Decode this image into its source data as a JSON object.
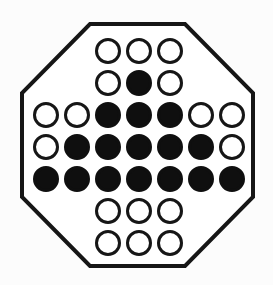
{
  "board": {
    "label": "octagonal-peg-solitaire-board",
    "canvas": {
      "width": 273,
      "height": 285
    },
    "colors": {
      "page_background": "#fcfcfc",
      "board_fill": "#ffffff",
      "outline": "#161616",
      "peg_fill": "#0f0f0f",
      "hole_fill": "#ffffff",
      "ring_stroke": "#161616"
    },
    "octagon": {
      "vertices": [
        [
          90,
          24
        ],
        [
          185,
          24
        ],
        [
          253,
          93
        ],
        [
          253,
          197
        ],
        [
          185,
          266
        ],
        [
          90,
          266
        ],
        [
          22,
          197
        ],
        [
          22,
          93
        ]
      ],
      "stroke_width": 4
    },
    "grid": {
      "col_x": [
        46,
        77,
        108,
        139,
        170,
        201,
        232
      ],
      "row_y": [
        51,
        83,
        115,
        147,
        179,
        211,
        243
      ],
      "hole_radius": 11.5,
      "ring_stroke_width": 3
    },
    "rows": [
      {
        "row": 0,
        "cols": [
          2,
          3,
          4
        ],
        "states": [
          "hole",
          "hole",
          "hole"
        ]
      },
      {
        "row": 1,
        "cols": [
          2,
          3,
          4
        ],
        "states": [
          "hole",
          "peg",
          "hole"
        ]
      },
      {
        "row": 2,
        "cols": [
          0,
          1,
          2,
          3,
          4,
          5,
          6
        ],
        "states": [
          "hole",
          "hole",
          "peg",
          "peg",
          "peg",
          "hole",
          "hole"
        ]
      },
      {
        "row": 3,
        "cols": [
          0,
          1,
          2,
          3,
          4,
          5,
          6
        ],
        "states": [
          "hole",
          "peg",
          "peg",
          "peg",
          "peg",
          "peg",
          "hole"
        ]
      },
      {
        "row": 4,
        "cols": [
          0,
          1,
          2,
          3,
          4,
          5,
          6
        ],
        "states": [
          "peg",
          "peg",
          "peg",
          "peg",
          "peg",
          "peg",
          "peg"
        ]
      },
      {
        "row": 5,
        "cols": [
          2,
          3,
          4
        ],
        "states": [
          "hole",
          "hole",
          "hole"
        ]
      },
      {
        "row": 6,
        "cols": [
          2,
          3,
          4
        ],
        "states": [
          "hole",
          "hole",
          "hole"
        ]
      }
    ],
    "counts": {
      "cells": 33,
      "pegs": 16,
      "holes": 17
    }
  }
}
